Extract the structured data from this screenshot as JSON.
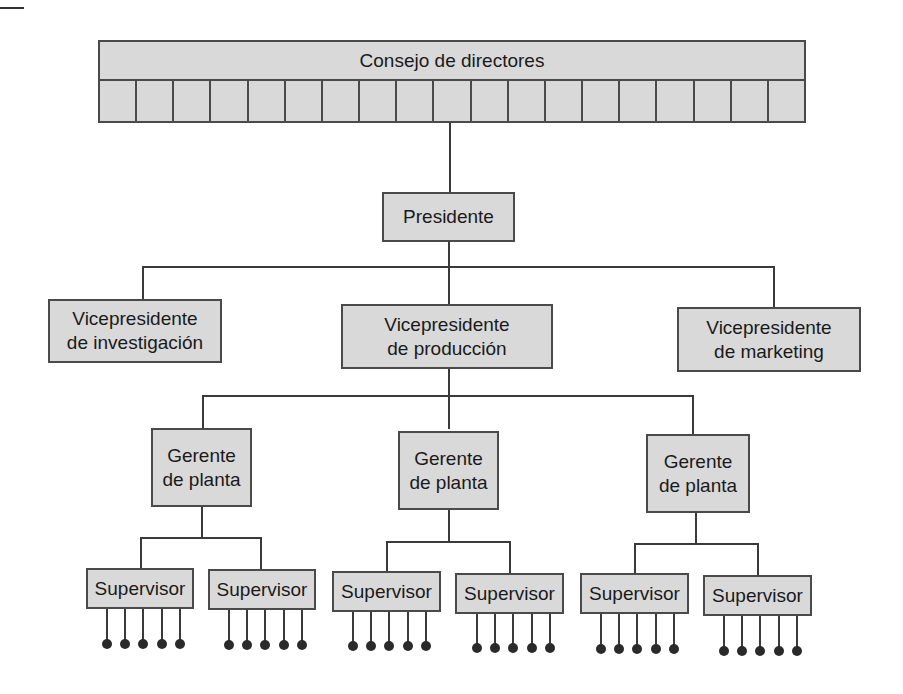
{
  "diagram": {
    "type": "org-chart",
    "board": {
      "label": "Consejo de directores",
      "cell_count": 19
    },
    "president": {
      "label": "Presidente"
    },
    "vice_presidents": [
      {
        "label": "Vicepresidente\nde investigación"
      },
      {
        "label": "Vicepresidente\nde producción"
      },
      {
        "label": "Vicepresidente\nde marketing"
      }
    ],
    "plant_managers": [
      {
        "label": "Gerente\nde planta"
      },
      {
        "label": "Gerente\nde planta"
      },
      {
        "label": "Gerente\nde planta"
      }
    ],
    "supervisors": [
      {
        "label": "Supervisor",
        "workers": 5
      },
      {
        "label": "Supervisor",
        "workers": 5
      },
      {
        "label": "Supervisor",
        "workers": 5
      },
      {
        "label": "Supervisor",
        "workers": 5
      },
      {
        "label": "Supervisor",
        "workers": 5
      },
      {
        "label": "Supervisor",
        "workers": 5
      }
    ],
    "colors": {
      "box_fill": "#d9d9d9",
      "border": "#4a4a4a",
      "line": "#3a3a3a",
      "worker_dot": "#2a2a2a"
    }
  }
}
